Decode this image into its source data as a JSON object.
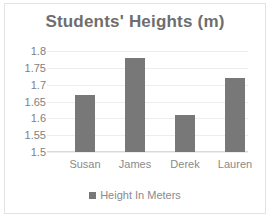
{
  "chart_data": {
    "type": "bar",
    "title": "Students' Heights (m)",
    "categories": [
      "Susan",
      "James",
      "Derek",
      "Lauren"
    ],
    "values": [
      1.67,
      1.78,
      1.61,
      1.72
    ],
    "series": [
      {
        "name": "Height In Meters",
        "values": [
          1.67,
          1.78,
          1.61,
          1.72
        ]
      }
    ],
    "xlabel": "",
    "ylabel": "",
    "ylim": [
      1.5,
      1.8
    ],
    "ytick_step": 0.05,
    "yticks": [
      "1.8",
      "1.75",
      "1.7",
      "1.65",
      "1.6",
      "1.55",
      "1.5"
    ],
    "ytick_values": [
      1.8,
      1.75,
      1.7,
      1.65,
      1.6,
      1.55,
      1.5
    ],
    "grid": true,
    "legend_position": "bottom",
    "legend": [
      "Height In Meters"
    ],
    "bar_color": "#787878",
    "gridline_color": "#ededed",
    "title_color": "#6e6e6e",
    "tick_label_color": "#808080",
    "border_color": "#e3e3e3"
  }
}
